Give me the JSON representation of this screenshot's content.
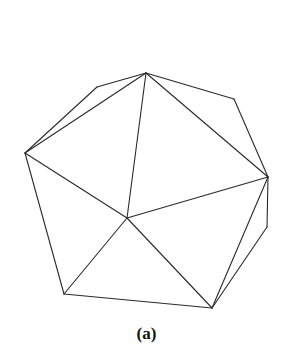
{
  "diagram": {
    "type": "triangulated-polygon",
    "caption": "(a)",
    "stroke_color": "#2a2a2a",
    "vertices": {
      "top": [
        146,
        73
      ],
      "upper_left": [
        97,
        87
      ],
      "left": [
        25,
        153
      ],
      "center": [
        127,
        218
      ],
      "upper_right": [
        234,
        99
      ],
      "right": [
        268,
        177
      ],
      "lower_right": [
        267,
        227
      ],
      "bottom_left": [
        64,
        294
      ],
      "bottom_right": [
        212,
        308
      ]
    },
    "edges": [
      [
        "left",
        "upper_left"
      ],
      [
        "upper_left",
        "top"
      ],
      [
        "top",
        "upper_right"
      ],
      [
        "upper_right",
        "right"
      ],
      [
        "right",
        "lower_right"
      ],
      [
        "lower_right",
        "bottom_right"
      ],
      [
        "bottom_right",
        "bottom_left"
      ],
      [
        "bottom_left",
        "left"
      ],
      [
        "left",
        "top"
      ],
      [
        "top",
        "right"
      ],
      [
        "top",
        "center"
      ],
      [
        "left",
        "center"
      ],
      [
        "right",
        "center"
      ],
      [
        "center",
        "bottom_left"
      ],
      [
        "center",
        "bottom_right"
      ],
      [
        "right",
        "bottom_right"
      ]
    ]
  }
}
